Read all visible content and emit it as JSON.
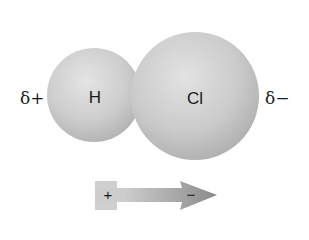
{
  "diagram": {
    "molecule": "HCl",
    "atoms": [
      {
        "symbol": "H",
        "label": "H"
      },
      {
        "symbol": "Cl",
        "label": "Cl"
      }
    ],
    "partial_charges": {
      "left": "δ+",
      "right": "δ−"
    },
    "dipole_arrow": {
      "tail_sign": "+",
      "head_sign": "−",
      "direction": "toward Cl"
    },
    "colors": {
      "sphere": "#c8c8c8",
      "sphere_highlight": "#e6e6e6",
      "sphere_shadow": "#a9a9a9",
      "arrow_tail": "#cfcfcf",
      "arrow_head": "#8e8e8e",
      "text": "#1a1a1a"
    }
  }
}
